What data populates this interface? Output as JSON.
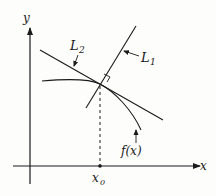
{
  "diagram": {
    "axes": {
      "x_label": "x",
      "y_label": "y"
    },
    "point": {
      "label": "x",
      "subscript": "0"
    },
    "lines": [
      {
        "name": "L",
        "subscript": "1",
        "description": "normal line"
      },
      {
        "name": "L",
        "subscript": "2",
        "description": "tangent line"
      }
    ],
    "curve": {
      "label": "f(x)"
    },
    "right_angle_marker": true,
    "colors": {
      "ink": "#1a1a1a",
      "background": "#fdfdfc"
    }
  }
}
